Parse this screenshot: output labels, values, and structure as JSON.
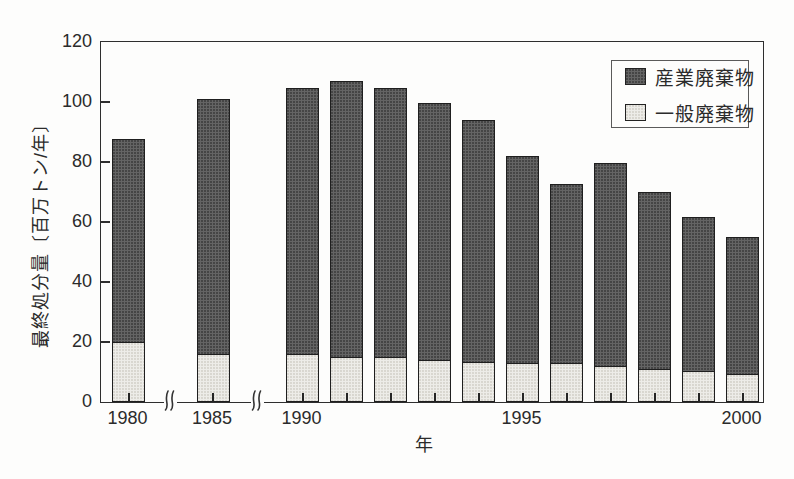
{
  "figure": {
    "background": "#fdfdfc"
  },
  "axes": {
    "x_title": "年",
    "y_title": "最終処分量〔百万トン/年〕",
    "y_ticks": [
      "0",
      "20",
      "40",
      "60",
      "80",
      "100",
      "120"
    ],
    "x_tick_labels": [
      "1980",
      "1985",
      "1990",
      "1995",
      "2000"
    ]
  },
  "legend": {
    "items": [
      {
        "label": "産業廃棄物",
        "swatch": "industrial"
      },
      {
        "label": "一般廃棄物",
        "swatch": "general"
      }
    ]
  },
  "colors": {
    "industrial_fill": "#646464",
    "industrial_dot": "#454545",
    "general_fill": "#edece8",
    "general_dot": "#d8d6d0",
    "axis": "#2e2e2e",
    "text": "#2b2b2b"
  },
  "chart_data": {
    "type": "bar",
    "stacked": true,
    "title": "",
    "xlabel": "年",
    "ylabel": "最終処分量〔百万トン/年〕",
    "ylim": [
      0,
      120
    ],
    "yticks": [
      0,
      20,
      40,
      60,
      80,
      100,
      120
    ],
    "grid": false,
    "legend_position": "top-right",
    "categories": [
      "1980",
      "1985",
      "1990",
      "1991",
      "1992",
      "1993",
      "1994",
      "1995",
      "1996",
      "1997",
      "1998",
      "1999",
      "2000"
    ],
    "labeled_categories": [
      "1980",
      "1985",
      "1990",
      "1995",
      "2000"
    ],
    "x_axis_breaks": [
      [
        "1980",
        "1985"
      ],
      [
        "1985",
        "1990"
      ]
    ],
    "series": [
      {
        "name": "産業廃棄物",
        "role": "industrial",
        "stack_position": "top",
        "values": [
          68,
          85.5,
          89,
          92.5,
          90,
          86,
          81,
          69.5,
          60,
          68,
          59.5,
          51.5,
          46
        ]
      },
      {
        "name": "一般廃棄物",
        "role": "general",
        "stack_position": "bottom",
        "values": [
          20,
          16,
          16,
          15,
          15,
          14,
          13.5,
          13,
          13,
          12,
          11,
          10.5,
          9.5
        ]
      }
    ],
    "totals": [
      88,
      101.5,
      105,
      107.5,
      105,
      100,
      94.5,
      82.5,
      73,
      80,
      70.5,
      62,
      55.5
    ]
  }
}
